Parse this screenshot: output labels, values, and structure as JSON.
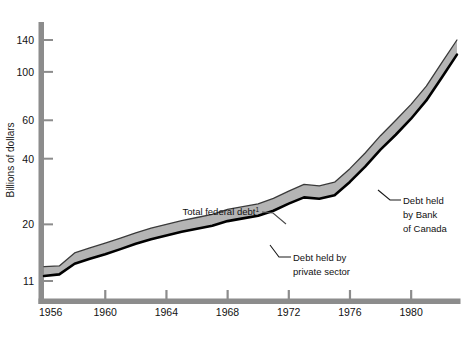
{
  "chart_data": {
    "type": "area",
    "title": "",
    "subtitle": "",
    "xlabel": "",
    "ylabel": "Billions of dollars",
    "yscale": "log",
    "ylim": [
      9.5,
      165
    ],
    "xlim": [
      1956,
      1983.2
    ],
    "grid": false,
    "legend_position": "inline-annotations",
    "x": [
      1956,
      1957,
      1958,
      1959,
      1960,
      1961,
      1962,
      1963,
      1964,
      1965,
      1966,
      1967,
      1968,
      1969,
      1970,
      1971,
      1972,
      1973,
      1974,
      1975,
      1976,
      1977,
      1978,
      1979,
      1980,
      1981,
      1982,
      1983
    ],
    "series": [
      {
        "name": "Total federal debt",
        "label_in_chart": "Total federal debt",
        "footnote_marker": "1",
        "values": [
          12.8,
          12.9,
          14.8,
          15.6,
          16.4,
          17.3,
          18.3,
          19.2,
          20.0,
          20.8,
          21.5,
          22.2,
          23.4,
          24.1,
          24.8,
          26.3,
          28.4,
          30.5,
          30.0,
          31.2,
          36.0,
          42.5,
          51.0,
          60.0,
          71.0,
          86.0,
          110.0,
          140.0
        ]
      },
      {
        "name": "Debt held by private sector",
        "label_in_chart": "Debt held by private sector",
        "values": [
          11.6,
          11.8,
          13.2,
          13.9,
          14.6,
          15.4,
          16.3,
          17.1,
          17.8,
          18.5,
          19.1,
          19.7,
          20.7,
          21.3,
          21.9,
          23.1,
          24.9,
          26.6,
          26.2,
          27.2,
          31.3,
          36.8,
          44.0,
          51.5,
          61.0,
          74.0,
          94.0,
          120.0
        ]
      }
    ],
    "band_label": "Debt held by Bank of Canada",
    "yticks": [
      11,
      20,
      40,
      60,
      100,
      140
    ],
    "ytick_labels": [
      "11",
      "20",
      "40",
      "60",
      "100",
      "140"
    ],
    "xticks": [
      1956,
      1960,
      1964,
      1968,
      1972,
      1976,
      1980
    ],
    "xtick_labels": [
      "1956",
      "1960",
      "1964",
      "1968",
      "1972",
      "1976",
      "1980"
    ],
    "colors": {
      "band_fill": "#b4b4b4",
      "line": "#000000",
      "axis": "#8c8c8c",
      "text": "#111111",
      "background": "#ffffff"
    }
  },
  "annotations": {
    "total_federal_debt": {
      "text": "Total federal debt",
      "superscript": "1"
    },
    "private_sector": {
      "line1": "Debt held by",
      "line2": "private sector"
    },
    "bank_of_canada": {
      "line1": "Debt held",
      "line2": "by Bank",
      "line3": "of Canada"
    }
  },
  "axis": {
    "y_title": "Billions of dollars"
  }
}
